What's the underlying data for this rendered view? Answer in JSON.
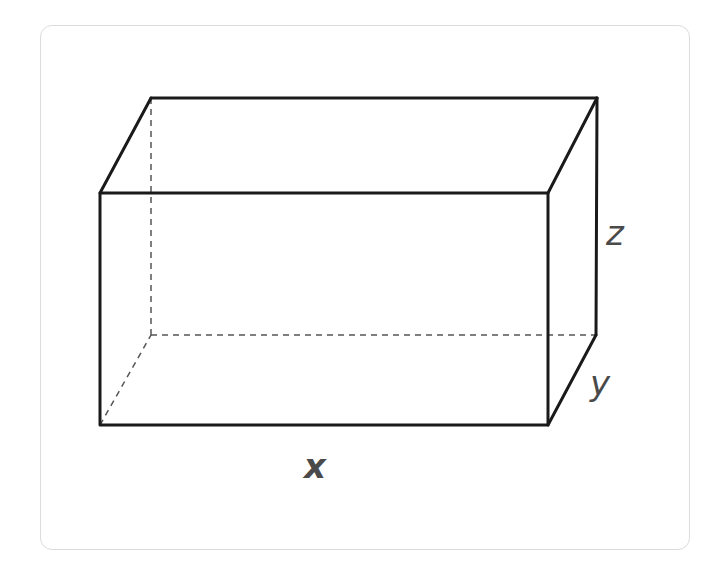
{
  "diagram": {
    "type": "rectangular-prism",
    "labels": {
      "x": "x",
      "y": "y",
      "z": "z"
    },
    "colors": {
      "visible_edge": "#1a1a1a",
      "hidden_edge": "#555555",
      "label": "#4a4a4a",
      "frame_border": "#dcdcdc",
      "background": "#ffffff"
    },
    "vertices": {
      "front_top_left": [
        100,
        193
      ],
      "front_top_right": [
        548,
        193
      ],
      "front_bottom_left": [
        100,
        425
      ],
      "front_bottom_right": [
        548,
        425
      ],
      "back_top_left": [
        151,
        98
      ],
      "back_top_right": [
        597,
        98
      ],
      "back_bottom_right": [
        596,
        335
      ],
      "back_bottom_left_hidden": [
        151,
        335
      ]
    }
  }
}
